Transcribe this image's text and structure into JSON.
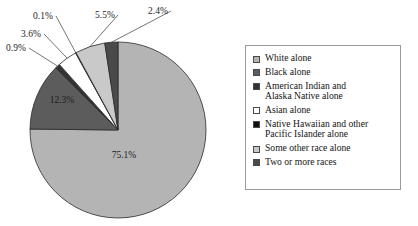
{
  "chart_data": {
    "type": "pie",
    "title": "",
    "subtitle": "",
    "xlabel": "",
    "ylabel": "",
    "legend_position": "right",
    "grid": false,
    "units": "percent",
    "start_angle_deg": 0,
    "direction": "clockwise",
    "categories": [
      "White alone",
      "Black alone",
      "American Indian and\nAlaska Native alone",
      "Asian alone",
      "Native Hawaiian and other\nPacific Islander alone",
      "Some other race alone",
      "Two or more races"
    ],
    "values": [
      75.1,
      12.3,
      0.9,
      3.6,
      0.1,
      5.5,
      2.4
    ],
    "labels": [
      "75.1%",
      "12.3%",
      "0.9%",
      "3.6%",
      "0.1%",
      "5.5%",
      "2.4%"
    ],
    "colors": [
      "#b4b4b4",
      "#5c5c5c",
      "#333333",
      "#ffffff",
      "#101010",
      "#c9c9c9",
      "#4a4a4a"
    ],
    "slices": [
      {
        "name": "White alone",
        "value": 75.1,
        "label": "75.1%",
        "color": "#b4b4b4",
        "label_placement": "inside",
        "label_x": 124,
        "label_y": 158
      },
      {
        "name": "Black alone",
        "value": 12.3,
        "label": "12.3%",
        "color": "#5c5c5c",
        "label_placement": "inside",
        "label_x": 62,
        "label_y": 103
      },
      {
        "name": "American Indian and Alaska Native alone",
        "value": 0.9,
        "label": "0.9%",
        "color": "#333333",
        "label_placement": "callout",
        "label_x": 6,
        "label_y": 51
      },
      {
        "name": "Asian alone",
        "value": 3.6,
        "label": "3.6%",
        "color": "#ffffff",
        "label_placement": "callout",
        "label_x": 21,
        "label_y": 37
      },
      {
        "name": "Native Hawaiian and other Pacific Islander alone",
        "value": 0.1,
        "label": "0.1%",
        "color": "#101010",
        "label_placement": "callout",
        "label_x": 33,
        "label_y": 19
      },
      {
        "name": "Some other race alone",
        "value": 5.5,
        "label": "5.5%",
        "color": "#c9c9c9",
        "label_placement": "callout",
        "label_x": 95,
        "label_y": 18
      },
      {
        "name": "Two or more races",
        "value": 2.4,
        "label": "2.4%",
        "color": "#4a4a4a",
        "label_placement": "callout",
        "label_x": 148,
        "label_y": 14
      }
    ],
    "geometry": {
      "center_x": 118,
      "center_y": 130,
      "radius": 88
    }
  },
  "legend": {
    "items": [
      {
        "label": "White alone",
        "color": "#b4b4b4"
      },
      {
        "label": "Black alone",
        "color": "#5c5c5c"
      },
      {
        "label": "American Indian and\nAlaska Native alone",
        "color": "#333333"
      },
      {
        "label": "Asian alone",
        "color": "#ffffff"
      },
      {
        "label": "Native Hawaiian and other\nPacific Islander alone",
        "color": "#101010"
      },
      {
        "label": "Some other race alone",
        "color": "#c9c9c9"
      },
      {
        "label": "Two or more races",
        "color": "#4a4a4a"
      }
    ]
  }
}
